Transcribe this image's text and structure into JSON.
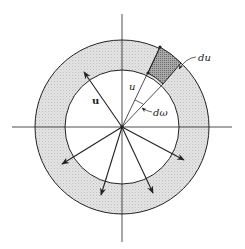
{
  "diagram": {
    "labels": {
      "vector": "u",
      "magnitude": "u",
      "shell_thickness": "du",
      "solid_angle": "dω"
    },
    "colors": {
      "line": "#222222",
      "shell_fill": "#dcdcdc",
      "element_fill": "#9a9a9a",
      "background": "#ffffff"
    },
    "geometry": {
      "center": [
        122,
        127
      ],
      "inner_radius": 57,
      "outer_radius": 87
    },
    "arrows": [
      {
        "name": "arrow-up-left",
        "to": [
          83,
          70
        ]
      },
      {
        "name": "arrow-left-down",
        "to": [
          61,
          164
        ]
      },
      {
        "name": "arrow-down",
        "to": [
          101,
          196
        ]
      },
      {
        "name": "arrow-down-right",
        "to": [
          153,
          194
        ]
      },
      {
        "name": "arrow-right-down",
        "to": [
          185,
          160
        ]
      }
    ]
  }
}
